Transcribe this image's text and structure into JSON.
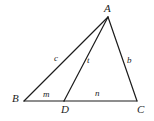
{
  "figure": {
    "type": "geometry-diagram",
    "background_color": "#ffffff",
    "stroke_color": "#1c1c1c",
    "label_color": "#1c1c1c"
  },
  "points": {
    "A": {
      "label": "A",
      "x": 108,
      "y": 17
    },
    "B": {
      "label": "B",
      "x": 24,
      "y": 101
    },
    "C": {
      "label": "C",
      "x": 137,
      "y": 101
    },
    "D": {
      "label": "D",
      "x": 64,
      "y": 101
    }
  },
  "segments": {
    "AB": {
      "label": "c",
      "from": "A",
      "to": "B"
    },
    "AC": {
      "label": "b",
      "from": "A",
      "to": "C"
    },
    "AD": {
      "label": "t",
      "from": "A",
      "to": "D"
    },
    "BD": {
      "label": "m",
      "from": "B",
      "to": "D"
    },
    "DC": {
      "label": "n",
      "from": "D",
      "to": "C"
    }
  }
}
